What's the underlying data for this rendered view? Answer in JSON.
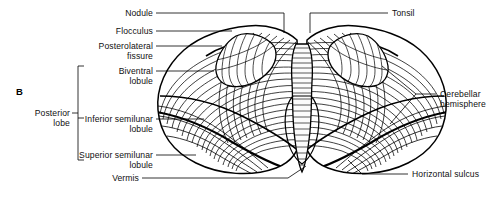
{
  "figure": {
    "panel_letter": "B",
    "line_color": "#000000",
    "background_color": "#ffffff"
  },
  "labels_left": [
    {
      "id": "nodule",
      "text": "Nodule"
    },
    {
      "id": "flocculus",
      "text": "Flocculus"
    },
    {
      "id": "posterolateral-fissure",
      "text": "Posterolateral\nfissure"
    },
    {
      "id": "biventral-lobule",
      "text": "Biventral\nlobule"
    },
    {
      "id": "inferior-semilunar-lobule",
      "text": "Inferior semilunar\nlobule"
    },
    {
      "id": "superior-semilunar-lobule",
      "text": "Superior semilunar\nlobule"
    },
    {
      "id": "vermis",
      "text": "Vermis"
    }
  ],
  "labels_right": [
    {
      "id": "tonsil",
      "text": "Tonsil"
    },
    {
      "id": "cerebellar-hemisphere",
      "text": "Cerebellar\nhemisphere"
    },
    {
      "id": "horizontal-sulcus",
      "text": "Horizontal sulcus"
    }
  ],
  "bracket": {
    "id": "posterior-lobe-bracket",
    "text": "Posterior\nlobe",
    "groups": [
      "Biventral lobule",
      "Inferior semilunar lobule",
      "Superior semilunar lobule"
    ]
  }
}
